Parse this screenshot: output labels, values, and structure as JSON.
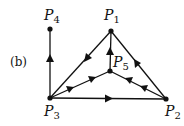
{
  "diagram": {
    "panel_label": "(b)",
    "nodes": [
      {
        "id": "P1",
        "name": "P",
        "sub": "1",
        "x": 111,
        "y": 31
      },
      {
        "id": "P2",
        "name": "P",
        "sub": "2",
        "x": 166,
        "y": 99
      },
      {
        "id": "P3",
        "name": "P",
        "sub": "3",
        "x": 50,
        "y": 98
      },
      {
        "id": "P4",
        "name": "P",
        "sub": "4",
        "x": 50,
        "y": 29
      },
      {
        "id": "P5",
        "name": "P",
        "sub": "5",
        "x": 110,
        "y": 71
      }
    ],
    "edges": [
      {
        "from": "P3",
        "to": "P4",
        "arrows": 1
      },
      {
        "from": "P1",
        "to": "P3",
        "arrows": 1
      },
      {
        "from": "P5",
        "to": "P1",
        "arrows": 1
      },
      {
        "from": "P2",
        "to": "P1",
        "arrows": 1
      },
      {
        "from": "P3",
        "to": "P2",
        "arrows": 1
      },
      {
        "from": "P3",
        "to": "P5",
        "arrows": 2
      },
      {
        "from": "P2",
        "to": "P5",
        "arrows": 2
      }
    ],
    "colors": {
      "stroke": "#111111",
      "background": "#ffffff"
    }
  }
}
